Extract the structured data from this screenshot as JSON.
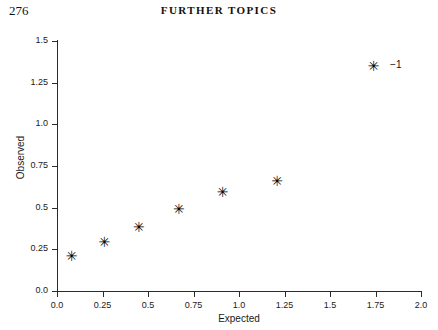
{
  "page": {
    "number": "276",
    "running_head": "FURTHER TOPICS"
  },
  "chart_data": {
    "type": "scatter",
    "title": "",
    "xlabel": "Expected",
    "ylabel": "Observed",
    "xlim": [
      0.0,
      2.0
    ],
    "ylim": [
      0.0,
      1.5
    ],
    "grid": false,
    "legend": null,
    "marker": "asterisk",
    "marker_glyph": "✳",
    "xticks": [
      0.0,
      0.25,
      0.5,
      0.75,
      1.0,
      1.25,
      1.5,
      1.75,
      2.0
    ],
    "xtick_labels": [
      "0.0",
      "0.25",
      "0.5",
      "0.75",
      "1.0",
      "1.25",
      "1.5",
      "1.75",
      "2.0"
    ],
    "yticks": [
      0.0,
      0.25,
      0.5,
      0.75,
      1.0,
      1.25,
      1.5
    ],
    "ytick_labels": [
      "0.0",
      "0.25",
      "0.5",
      "0.75",
      "1.0",
      "1.25",
      "1.5"
    ],
    "points": [
      {
        "x": 0.08,
        "y": 0.21,
        "label": null
      },
      {
        "x": 0.26,
        "y": 0.29,
        "label": null
      },
      {
        "x": 0.45,
        "y": 0.38,
        "label": null
      },
      {
        "x": 0.67,
        "y": 0.49,
        "label": null
      },
      {
        "x": 0.91,
        "y": 0.59,
        "label": null
      },
      {
        "x": 1.21,
        "y": 0.66,
        "label": null
      },
      {
        "x": 1.74,
        "y": 1.35,
        "label": "−1"
      }
    ],
    "annotations": [
      {
        "text": "−1",
        "x": 1.83,
        "y": 1.35
      }
    ]
  }
}
